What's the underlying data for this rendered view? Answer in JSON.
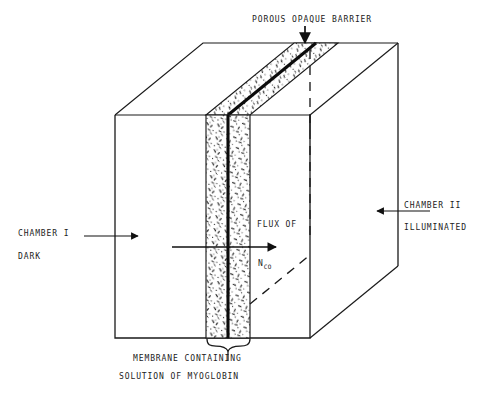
{
  "figure": {
    "kind": "technical-line-diagram",
    "background_color": "#ffffff",
    "ink_color": "#1a1a1a"
  },
  "labels": {
    "porous_barrier": "POROUS  OPAQUE  BARRIER",
    "chamber_i": "CHAMBER  I",
    "chamber_i_state": "DARK",
    "chamber_ii": "CHAMBER  II",
    "chamber_ii_state": "ILLUMINATED",
    "flux_of": "FLUX  OF",
    "flux_symbol_main": "N",
    "flux_symbol_sub": "CO",
    "membrane_line1": "MEMBRANE CONTAINING",
    "membrane_line2": "SOLUTION OF MYOGLOBIN"
  },
  "icons": {
    "arrow_down": "down-arrow-icon",
    "arrow_right": "right-arrow-icon",
    "arrow_left": "left-arrow-icon",
    "brace": "curly-brace-icon"
  },
  "geometry": {
    "box_front_left_x": 115,
    "box_front_right_x": 310,
    "box_front_top_y": 115,
    "box_front_bottom_y": 338,
    "box_back_offset_x": 88,
    "box_back_offset_y": -72,
    "membrane_left_x": 206,
    "membrane_right_x": 250,
    "barrier_x": 228,
    "barrier_stroke_width": 3
  },
  "annotations": {
    "barrier_arrow": {
      "from_x": 305,
      "from_y": 26,
      "to_x": 305,
      "to_y": 46
    },
    "chamber_i_arrow": {
      "from_x": 84,
      "from_y": 236,
      "to_x": 140,
      "to_y": 236
    },
    "chamber_ii_arrow": {
      "from_x": 428,
      "from_y": 211,
      "to_x": 375,
      "to_y": 211
    },
    "flux_arrow": {
      "from_x": 172,
      "from_y": 247,
      "to_x": 279,
      "to_y": 247
    },
    "membrane_brace": {
      "left_x": 207,
      "right_x": 250,
      "y": 341,
      "stem_to_y": 352
    }
  }
}
